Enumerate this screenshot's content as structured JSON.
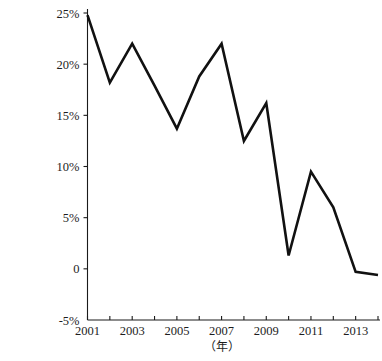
{
  "chart_data": {
    "type": "line",
    "title": "",
    "xlabel": "（年）",
    "ylabel": "",
    "x": [
      2001,
      2002,
      2003,
      2004,
      2005,
      2006,
      2007,
      2008,
      2009,
      2010,
      2011,
      2012,
      2013,
      2014
    ],
    "values": [
      24.8,
      18.2,
      22.0,
      17.9,
      13.7,
      18.8,
      22.0,
      12.5,
      16.2,
      1.3,
      9.5,
      6.0,
      -0.3,
      -0.6
    ],
    "series": [
      {
        "name": "",
        "values": [
          24.8,
          18.2,
          22.0,
          17.9,
          13.7,
          18.8,
          22.0,
          12.5,
          16.2,
          1.3,
          9.5,
          6.0,
          -0.3,
          -0.6
        ]
      }
    ],
    "xlim": [
      2001,
      2014
    ],
    "ylim": [
      -5,
      25
    ],
    "ytick_values": [
      25,
      20,
      15,
      10,
      5,
      0,
      -5
    ],
    "ytick_labels": [
      "25%",
      "20%",
      "15%",
      "10%",
      "5%",
      "0",
      "-5%"
    ],
    "xtick_values": [
      2001,
      2002,
      2003,
      2004,
      2005,
      2006,
      2007,
      2008,
      2009,
      2010,
      2011,
      2012,
      2013,
      2014
    ],
    "xtick_labels": [
      "2001",
      "",
      "2003",
      "",
      "2005",
      "",
      "2007",
      "",
      "2009",
      "",
      "2011",
      "",
      "2013",
      ""
    ],
    "grid": false,
    "legend": false,
    "legend_position": "none",
    "line_color": "#111111"
  }
}
